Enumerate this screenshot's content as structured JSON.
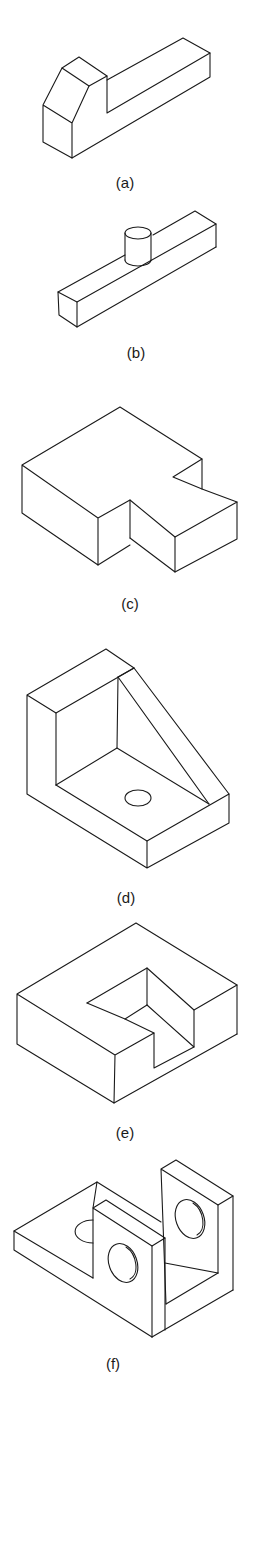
{
  "figure": {
    "type": "isometric-drawing-set",
    "background": "#ffffff",
    "line_color": "#1a1a1a",
    "panels": [
      {
        "id": "a",
        "label": "(a)",
        "description": "Long block with raised chamfered end"
      },
      {
        "id": "b",
        "label": "(b)",
        "description": "Long rectangular bar with cylindrical boss on top"
      },
      {
        "id": "c",
        "label": "(c)",
        "description": "Block with rectangular notch and angled cut"
      },
      {
        "id": "d",
        "label": "(d)",
        "description": "Angle bracket with triangular gusset and hole in base"
      },
      {
        "id": "e",
        "label": "(e)",
        "description": "Block with L-shaped recessed pocket"
      },
      {
        "id": "f",
        "label": "(f)",
        "description": "Base plate with two uprights, each with a through hole, and a half hole in the base"
      }
    ]
  }
}
